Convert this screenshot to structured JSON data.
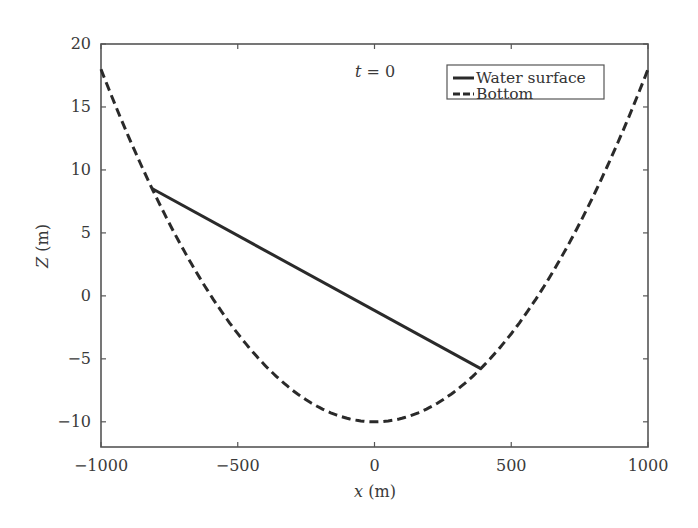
{
  "chart_data": {
    "type": "line",
    "title": "",
    "annotation": "t = 0",
    "xlabel": "x (m)",
    "ylabel": "Z (m)",
    "xlim": [
      -1000,
      1000
    ],
    "ylim": [
      -12,
      20
    ],
    "xticks": [
      -1000,
      -500,
      0,
      500,
      1000
    ],
    "xtick_labels": [
      "−1000",
      "−500",
      "0",
      "500",
      "1000"
    ],
    "yticks": [
      -10,
      -5,
      0,
      5,
      10,
      15,
      20
    ],
    "ytick_labels": [
      "−10",
      "−5",
      "0",
      "5",
      "10",
      "15",
      "20"
    ],
    "grid": false,
    "legend_position": "upper right",
    "series": [
      {
        "name": "Water surface",
        "style": "solid",
        "color": "#2a2a2a",
        "x": [
          -812,
          390
        ],
        "y": [
          8.5,
          -5.8
        ]
      },
      {
        "name": "Bottom",
        "style": "dashed",
        "color": "#2a2a2a",
        "x": [
          -1000,
          -900,
          -800,
          -700,
          -600,
          -500,
          -400,
          -300,
          -200,
          -100,
          0,
          100,
          200,
          300,
          400,
          500,
          600,
          700,
          800,
          900,
          1000
        ],
        "y": [
          18,
          12.68,
          7.92,
          3.72,
          0.08,
          -3,
          -5.52,
          -7.48,
          -8.88,
          -9.72,
          -10,
          -9.72,
          -8.88,
          -7.48,
          -5.52,
          -3,
          0.08,
          3.72,
          7.92,
          12.68,
          18
        ]
      }
    ]
  }
}
